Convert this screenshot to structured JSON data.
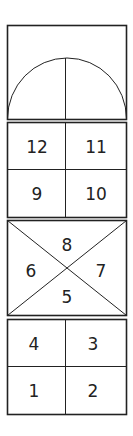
{
  "diagram": {
    "title": "",
    "panels": [
      {
        "id": "arch",
        "type": "semicircle-arch",
        "labels": []
      },
      {
        "id": "grid-top",
        "type": "2x2-grid",
        "cells": [
          "12",
          "11",
          "9",
          "10"
        ]
      },
      {
        "id": "x-box",
        "type": "diagonal-cross",
        "cells": {
          "top": "8",
          "left": "6",
          "right": "7",
          "bottom": "5"
        }
      },
      {
        "id": "grid-bottom",
        "type": "2x2-grid",
        "cells": [
          "4",
          "3",
          "1",
          "2"
        ]
      }
    ],
    "colors": {
      "line": "#222222",
      "background": "#ffffff"
    }
  }
}
